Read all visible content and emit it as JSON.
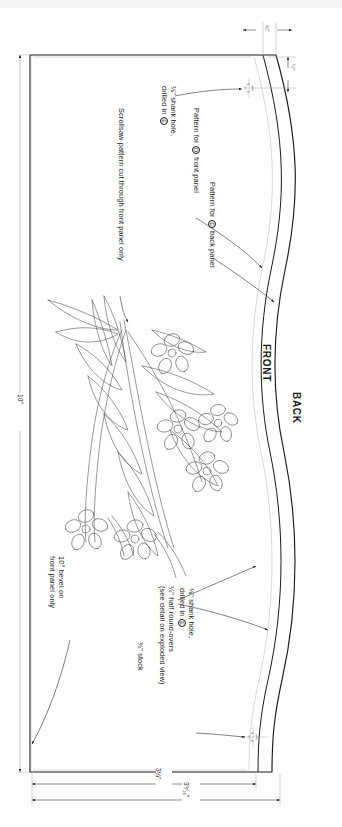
{
  "drawing": {
    "title": "Front and back panel pattern",
    "type": "woodworking-pattern",
    "stroke_color": "#1a1a1a",
    "light_stroke_color": "#8a8a8a",
    "background": "#ffffff"
  },
  "side_labels": {
    "front": "FRONT",
    "back": "BACK"
  },
  "dimensions": {
    "height_left": "10\"",
    "bottom_inner": "3¼\"",
    "bottom_outer": "3⁹⁄₁₆\"",
    "top_offset": "¾\"",
    "right_offset": "½\""
  },
  "notes": {
    "pattern_front_pre": "Pattern for ",
    "pattern_front_mark": "D",
    "pattern_front_post": " front panel",
    "pattern_back_pre": "Pattern for ",
    "pattern_back_mark": "E",
    "pattern_back_post": " back panel",
    "shank_hole_line1": "⅛\" shank hole,",
    "shank_hole_line2_pre": "drilled in ",
    "shank_hole_mark": "E",
    "scrollsaw": "Scrollsaw pattern cut through front panel only",
    "roundover_line1": "¼\" half round-overs",
    "roundover_line2": "(see detail on exploded view)",
    "bevel_line1": "10° bevel on",
    "bevel_line2": "front panel only",
    "stock": "¾\" stock"
  },
  "icons": {
    "hole_top": "drill-hole-icon",
    "hole_bottom": "drill-hole-icon"
  }
}
